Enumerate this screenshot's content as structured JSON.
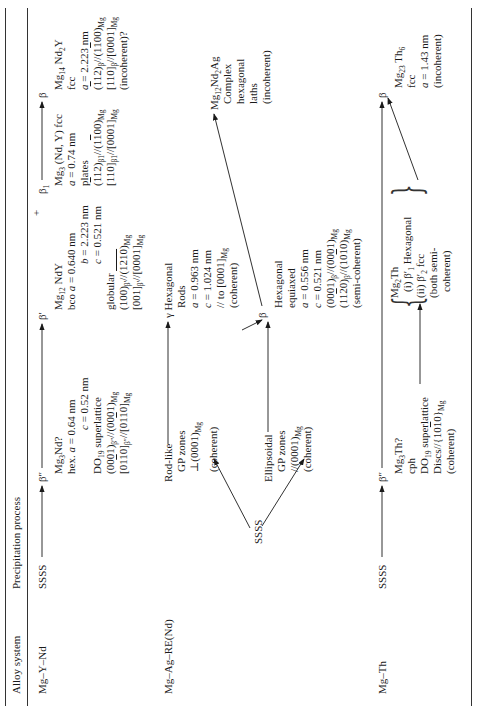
{
  "orientation": "rotated-90-ccw",
  "table": {
    "headers": {
      "alloy_system": "Alloy system",
      "process": "Precipitation process"
    },
    "rows": [
      {
        "alloy": "Mg–Y–Nd",
        "start": "SSSS",
        "stages": {
          "b2": {
            "symbol": "β″",
            "lines": [
              "Mg3Nd?",
              "hex. a = 0.64 nm",
              "c = 0.52 nm",
              "DO19 superlattice",
              "(0001)β″//(0001)Mg",
              "[0110]β″//[0110]Mg"
            ]
          },
          "b1p": {
            "symbol": "β′",
            "plus": "+",
            "lines": [
              "Mg12 NdY",
              "bco a = 0.640 nm",
              "b = 2.223 nm",
              "c = 0.521 nm",
              "globular",
              "(100)β′//(1210)Mg",
              "[001]β′//[0001]Mg"
            ]
          },
          "b1": {
            "symbol": "β1",
            "lines": [
              "Mg3 (Nd, Y) fcc",
              "a = 0.74 nm",
              "plates",
              "(112)β1//(1100)Mg",
              "[110]β1//[0001]Mg"
            ]
          },
          "b": {
            "symbol": "β",
            "lines": [
              "Mg14 Nd2Y",
              "fcc",
              "a = 2.223 nm",
              "(112)β//(1100)Mg",
              "[110]β//[0001]Mg",
              "(incoherent)?"
            ]
          }
        }
      },
      {
        "alloy": "Mg–Ag–RE(Nd)",
        "start": "SSSS",
        "stages": {
          "gp_rod": {
            "lines": [
              "Rod-like",
              "GP zones",
              "⊥(0001)Mg",
              "(coherent)"
            ]
          },
          "gp_ell": {
            "lines": [
              "Ellipsoidal",
              "GP zones",
              "//(0001)Mg",
              "(coherent)"
            ]
          },
          "gamma": {
            "lines": [
              "γ Hexagonal",
              "Rods",
              "a = 0.963 nm",
              "c = 1.024 nm",
              "// to [0001]Mg",
              "(coherent)"
            ]
          },
          "beta": {
            "symbol": "β",
            "lines": [
              "Hexagonal",
              "equiaxed",
              "a = 0.556 nm",
              "c = 0.521 nm",
              "(0001)β//(0001)Mg",
              "(1120)β//(1010)Mg",
              "(semi-coherent)"
            ]
          },
          "final": {
            "lines": [
              "Mg12Nd2Ag",
              "Complex",
              "hexagonal",
              "laths",
              "(incoherent)"
            ]
          }
        }
      },
      {
        "alloy": "Mg–Th",
        "start": "SSSS",
        "stages": {
          "b2": {
            "symbol": "β″",
            "lines": [
              "Mg3Th?",
              "cph",
              "DO19 superlattice",
              "Discs//{1010}Mg",
              "(coherent)"
            ]
          },
          "b1": {
            "lines": [
              "Mg2Th",
              "(i) β′1 Hexagonal",
              "(ii) β′2 fcc",
              "(both semi-",
              "coherent)"
            ]
          },
          "b": {
            "symbol": "β",
            "lines": [
              "Mg23 Th6",
              "fcc",
              "a = 1.43 nm",
              "(incoherent)"
            ]
          }
        }
      }
    ]
  },
  "colors": {
    "ink": "#1a1a1a",
    "rule": "#333333",
    "background": "#ffffff"
  }
}
